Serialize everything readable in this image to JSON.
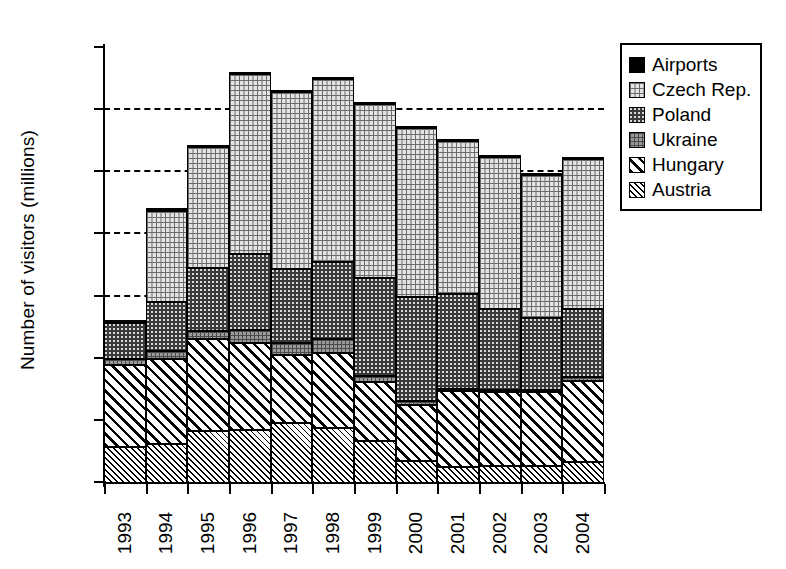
{
  "chart_data": {
    "type": "bar",
    "subtype": "stacked",
    "title": "",
    "xlabel": "",
    "ylabel": "Number of visitors (millions)",
    "ylim": [
      0,
      35
    ],
    "ytick_step": 5,
    "yticks": [
      0,
      5,
      10,
      15,
      20,
      25,
      30,
      35
    ],
    "gridlines": [
      15,
      20,
      25,
      30
    ],
    "grid": "horizontal-dashed-partial",
    "legend_position": "top-right-outside",
    "categories": [
      "1993",
      "1994",
      "1995",
      "1996",
      "1997",
      "1998",
      "1999",
      "2000",
      "2001",
      "2002",
      "2003",
      "2004"
    ],
    "series": [
      {
        "name": "Austria",
        "values": [
          2.9,
          3.1,
          4.2,
          4.3,
          4.8,
          4.4,
          3.4,
          1.8,
          1.3,
          1.4,
          1.4,
          1.7
        ]
      },
      {
        "name": "Hungary",
        "values": [
          6.6,
          6.9,
          7.4,
          7.0,
          5.5,
          6.1,
          4.7,
          4.5,
          6.1,
          5.9,
          5.9,
          6.5
        ]
      },
      {
        "name": "Ukraine",
        "values": [
          0.5,
          0.6,
          0.6,
          1.0,
          1.0,
          1.1,
          0.5,
          0.3,
          0.2,
          0.2,
          0.2,
          0.3
        ]
      },
      {
        "name": "Poland",
        "values": [
          2.9,
          4.0,
          5.1,
          6.1,
          5.9,
          6.2,
          7.9,
          8.4,
          7.6,
          6.5,
          5.8,
          5.5
        ]
      },
      {
        "name": "Czech Rep.",
        "values": [
          0.0,
          7.3,
          9.7,
          14.5,
          14.3,
          14.7,
          14.0,
          13.6,
          12.3,
          12.2,
          11.5,
          12.1
        ]
      },
      {
        "name": "Airports",
        "values": [
          0.2,
          0.2,
          0.2,
          0.1,
          0.1,
          0.1,
          0.1,
          0.1,
          0.1,
          0.1,
          0.1,
          0.1
        ]
      }
    ],
    "stack_order_bottom_to_top": [
      "Austria",
      "Hungary",
      "Ukraine",
      "Poland",
      "Czech Rep.",
      "Airports"
    ],
    "totals": [
      13.1,
      22.1,
      27.2,
      33.0,
      31.6,
      32.6,
      30.6,
      28.7,
      27.6,
      26.3,
      24.9,
      26.2
    ]
  },
  "legend": {
    "items": [
      {
        "label": "Airports",
        "pattern": "solid-black"
      },
      {
        "label": "Czech Rep.",
        "pattern": "brick"
      },
      {
        "label": "Poland",
        "pattern": "dark-dotted"
      },
      {
        "label": "Ukraine",
        "pattern": "grey-grid"
      },
      {
        "label": "Hungary",
        "pattern": "diagonal-hatch"
      },
      {
        "label": "Austria",
        "pattern": "fine-diagonal-hatch"
      }
    ]
  },
  "colors": {
    "axis": "#000000",
    "background": "#ffffff",
    "airports": "#000000",
    "czech": "#e3e3e3",
    "poland": "#3a3a3a",
    "ukraine": "#9a9a9a",
    "hungary": "#ffffff",
    "austria": "#ffffff"
  }
}
